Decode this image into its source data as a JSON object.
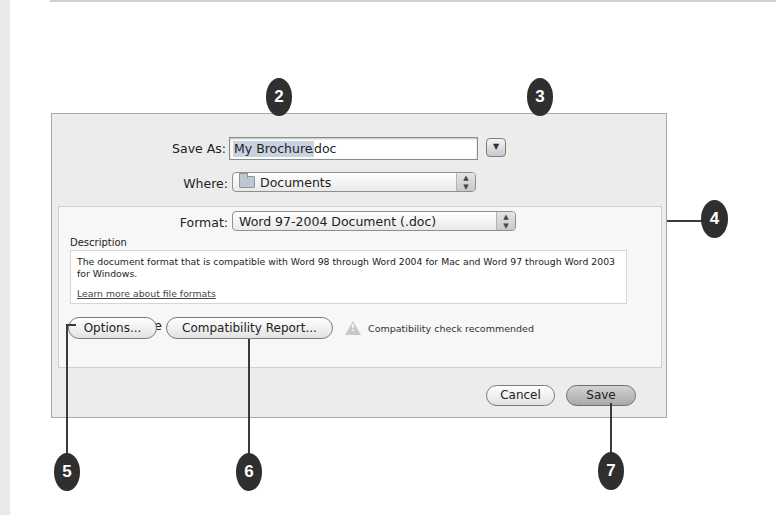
{
  "dialog": {
    "save_as": {
      "label": "Save As:",
      "value_selected": "My Brochure",
      "value_ext": ".doc",
      "expand_button_icon": "disclosure-down-icon"
    },
    "where": {
      "label": "Where:",
      "value": "Documents",
      "icon": "folder-icon"
    },
    "format": {
      "label": "Format:",
      "value": "Word 97-2004 Document (.doc)"
    },
    "description": {
      "title": "Description",
      "text": "The document format that is compatible with Word 98 through Word 2004 for Mac and Word 97 through Word 2003 for Windows.",
      "link": "Learn more about file formats"
    },
    "append_extension": {
      "label": "Append file extension",
      "checked": true
    },
    "buttons": {
      "options": "Options...",
      "compatibility_report": "Compatibility Report...",
      "cancel": "Cancel",
      "save": "Save"
    },
    "warning": {
      "icon": "warning-triangle-icon",
      "text": "Compatibility check recommended"
    }
  },
  "callouts": [
    "2",
    "3",
    "4",
    "5",
    "6",
    "7"
  ],
  "colors": {
    "callout_bg": "#2f2f2f",
    "dialog_bg": "#ececec",
    "selection": "#c9d3e0"
  }
}
